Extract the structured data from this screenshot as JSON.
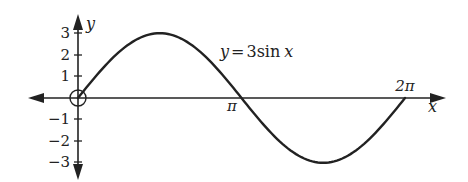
{
  "chart_data": {
    "type": "line",
    "title": "",
    "function_label": "y = 3sin x",
    "xlabel": "x",
    "ylabel": "y",
    "x_ticks": [
      "π",
      "2π"
    ],
    "y_ticks": [
      "3",
      "2",
      "1",
      "−1",
      "−2",
      "−3"
    ],
    "ylim": [
      -3,
      3
    ],
    "xlim": [
      0,
      6.2832
    ],
    "series": [
      {
        "name": "y = 3sin x",
        "x": [
          0,
          0.7854,
          1.5708,
          2.3562,
          3.1416,
          3.927,
          4.7124,
          5.4978,
          6.2832
        ],
        "values": [
          0,
          2.12,
          3,
          2.12,
          0,
          -2.12,
          -3,
          -2.12,
          0
        ]
      }
    ],
    "origin_marker": "open circle at (0,0)",
    "grid": false,
    "legend": "none"
  },
  "labels": {
    "y_axis": "y",
    "x_axis": "x",
    "pi": "π",
    "two_pi": "2π",
    "func_y": "y",
    "func_eq": "=",
    "func_body": "3sin",
    "func_x": "x",
    "t3": "3",
    "t2": "2",
    "t1": "1",
    "tm1": "−1",
    "tm2": "−2",
    "tm3": "−3"
  },
  "colors": {
    "stroke": "#222222",
    "background": "#ffffff"
  }
}
